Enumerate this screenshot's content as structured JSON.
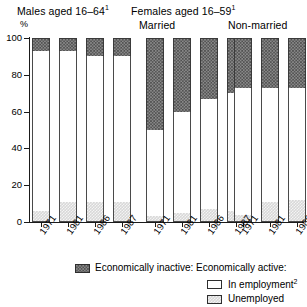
{
  "titles": {
    "males": "Males aged 16–64",
    "males_sup": "1",
    "females": "Females aged 16–59",
    "females_sup": "1",
    "married": "Married",
    "nonmarried": "Non-married",
    "percent_label": "%"
  },
  "legend": {
    "inactive_label": "Economically inactive:",
    "active_label": "Economically active:",
    "employment_label": "In employment",
    "employment_sup": "2",
    "unemployed_label": "Unemployed"
  },
  "axis": {
    "y_ticks": [
      "0",
      "20",
      "40",
      "60",
      "80",
      "100"
    ],
    "y_min": 0,
    "y_max": 100
  },
  "colors": {
    "inactive": "#6b6b6b",
    "employment": "#ffffff",
    "unemployed": "#d8d8d8",
    "axis": "#1a1a1a"
  },
  "chart_data": {
    "type": "bar",
    "subtype": "stacked-column",
    "xlabel": "",
    "ylabel": "%",
    "ylim": [
      0,
      100
    ],
    "ytick_interval": 20,
    "grid": false,
    "legend_position": "bottom",
    "stack_order": [
      "Unemployed",
      "In employment",
      "Economically inactive"
    ],
    "groups": [
      {
        "name": "Males aged 16–64",
        "categories": [
          "1971",
          "1981",
          "1986",
          "1987"
        ],
        "series": [
          {
            "name": "Unemployed",
            "values": [
              6,
              11,
              11,
              11
            ]
          },
          {
            "name": "In employment",
            "values": [
              87,
              82,
              79,
              79
            ]
          },
          {
            "name": "Economically inactive",
            "values": [
              7,
              7,
              10,
              10
            ]
          }
        ]
      },
      {
        "name": "Females aged 16–59 — Married",
        "categories": [
          "1971",
          "1981",
          "1986",
          "1987"
        ],
        "series": [
          {
            "name": "Unemployed",
            "values": [
              3,
              5,
              7,
              6
            ]
          },
          {
            "name": "In employment",
            "values": [
              47,
              55,
              60,
              64
            ]
          },
          {
            "name": "Economically inactive",
            "values": [
              50,
              40,
              33,
              30
            ]
          }
        ]
      },
      {
        "name": "Females aged 16–59 — Non-married",
        "categories": [
          "1971",
          "1981",
          "1986",
          "1987"
        ],
        "series": [
          {
            "name": "Unemployed",
            "values": [
              4,
              11,
              12,
              10
            ]
          },
          {
            "name": "In employment",
            "values": [
              69,
              62,
              61,
              63
            ]
          },
          {
            "name": "Economically inactive",
            "values": [
              27,
              27,
              27,
              27
            ]
          }
        ]
      }
    ]
  }
}
